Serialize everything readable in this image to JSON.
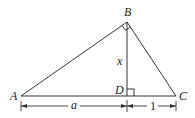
{
  "diagram": {
    "type": "right-triangle-with-altitude",
    "vertices": {
      "A": {
        "label": "A",
        "x": 21,
        "y": 96
      },
      "B": {
        "label": "B",
        "x": 127,
        "y": 22
      },
      "C": {
        "label": "C",
        "x": 176,
        "y": 96
      },
      "D": {
        "label": "D",
        "x": 127,
        "y": 96
      }
    },
    "segments": [
      {
        "from": "A",
        "to": "B"
      },
      {
        "from": "B",
        "to": "C"
      },
      {
        "from": "A",
        "to": "C"
      },
      {
        "from": "B",
        "to": "D",
        "label": "x"
      }
    ],
    "right_angles": [
      "B",
      "D"
    ],
    "labels": {
      "A": "A",
      "B": "B",
      "C": "C",
      "D": "D",
      "altitude": "x",
      "AD": "a",
      "DC": "1"
    },
    "dimensions": [
      {
        "from": "A",
        "to": "D",
        "label": "a"
      },
      {
        "from": "D",
        "to": "C",
        "label": "1"
      }
    ],
    "colors": {
      "stroke": "#333333",
      "text": "#222222",
      "background": "#ffffff"
    }
  }
}
